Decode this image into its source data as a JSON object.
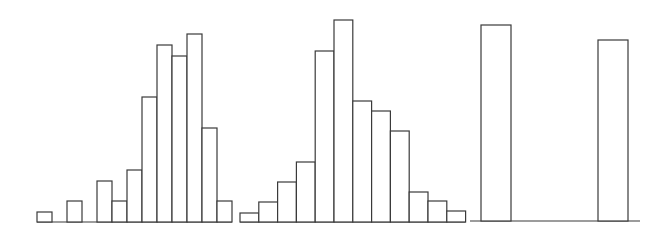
{
  "chart_data": [
    {
      "type": "bar",
      "title": "",
      "xlabel": "",
      "ylabel": "",
      "grid": false,
      "legend": null,
      "description": "Left-skewed histogram (14 bins)",
      "categories": [
        "1",
        "2",
        "3",
        "4",
        "5",
        "6",
        "7",
        "8",
        "9",
        "10",
        "11",
        "12",
        "13"
      ],
      "values": [
        10,
        0,
        21,
        0,
        41,
        21,
        52,
        125,
        177,
        166,
        188,
        94,
        21
      ],
      "ylim": [
        0,
        200
      ],
      "geometry": {
        "x0": 37,
        "bin_width": 15,
        "baseline": 222
      }
    },
    {
      "type": "bar",
      "title": "",
      "xlabel": "",
      "ylabel": "",
      "grid": false,
      "legend": null,
      "description": "Roughly symmetric / slightly right-skewed histogram (12 bins)",
      "categories": [
        "1",
        "2",
        "3",
        "4",
        "5",
        "6",
        "7",
        "8",
        "9",
        "10",
        "11",
        "12"
      ],
      "values": [
        9,
        20,
        40,
        60,
        171,
        202,
        121,
        111,
        91,
        30,
        21,
        11
      ],
      "ylim": [
        0,
        210
      ],
      "geometry": {
        "x0": 240,
        "bin_width": 18.8,
        "baseline": 222
      }
    },
    {
      "type": "bar",
      "title": "",
      "xlabel": "",
      "ylabel": "",
      "grid": false,
      "legend": null,
      "description": "Bimodal distribution with two isolated bars",
      "categories": [
        "low",
        "high"
      ],
      "values": [
        196,
        181
      ],
      "ylim": [
        0,
        200
      ],
      "geometry": {
        "axis_x0": 470,
        "axis_x1": 640,
        "baseline": 221,
        "bars": [
          {
            "x": 481,
            "w": 30
          },
          {
            "x": 598,
            "w": 30
          }
        ]
      }
    }
  ],
  "colors": {
    "stroke": "#3a3a3a",
    "fill": "#ffffff",
    "background": "#ffffff"
  }
}
